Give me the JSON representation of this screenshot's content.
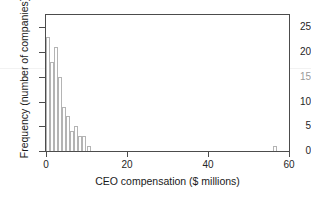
{
  "chart_data": {
    "type": "bar",
    "title": "",
    "subtitle": "",
    "xlabel": "CEO compensation ($ millions)",
    "ylabel": "Frequency (number of companies)",
    "xlim": [
      0,
      60
    ],
    "ylim": [
      0,
      27.5
    ],
    "bin_width": 1,
    "grid": false,
    "legend": null,
    "xticks": [
      0,
      20,
      40,
      60
    ],
    "xtick_labels": [
      "0",
      "20",
      "40",
      "60"
    ],
    "yticks": [
      0,
      5,
      10,
      15,
      20,
      25
    ],
    "ytick_labels": [
      "0",
      "5",
      "10",
      "15",
      "20",
      "25"
    ],
    "bin_edges": [
      0,
      1,
      2,
      3,
      4,
      5,
      6,
      7,
      8,
      9,
      10,
      11,
      56,
      57
    ],
    "bars": [
      {
        "x0": 0,
        "x1": 1,
        "value": 23
      },
      {
        "x0": 1,
        "x1": 2,
        "value": 18
      },
      {
        "x0": 2,
        "x1": 3,
        "value": 21
      },
      {
        "x0": 3,
        "x1": 4,
        "value": 15
      },
      {
        "x0": 4,
        "x1": 5,
        "value": 9
      },
      {
        "x0": 5,
        "x1": 6,
        "value": 7
      },
      {
        "x0": 6,
        "x1": 7,
        "value": 4
      },
      {
        "x0": 7,
        "x1": 8,
        "value": 5
      },
      {
        "x0": 8,
        "x1": 9,
        "value": 3
      },
      {
        "x0": 9,
        "x1": 10,
        "value": 3
      },
      {
        "x0": 10,
        "x1": 11,
        "value": 1
      },
      {
        "x0": 56,
        "x1": 57,
        "value": 1
      }
    ],
    "categories": [
      "0-1",
      "1-2",
      "2-3",
      "3-4",
      "4-5",
      "5-6",
      "6-7",
      "7-8",
      "8-9",
      "9-10",
      "10-11",
      "56-57"
    ],
    "values": [
      23,
      18,
      21,
      15,
      9,
      7,
      4,
      5,
      3,
      3,
      1,
      1
    ],
    "annotations": [
      {
        "name": "faint-horizontal-artifact-line",
        "y": 17.5
      }
    ],
    "colors": {
      "bar_edge": "#b4b4b4",
      "bar_fill": "#ffffff",
      "frame": "#4c4c4c",
      "text": "#1a1a1a",
      "artifact_line": "#f2f2f2",
      "background": "#ffffff"
    }
  }
}
